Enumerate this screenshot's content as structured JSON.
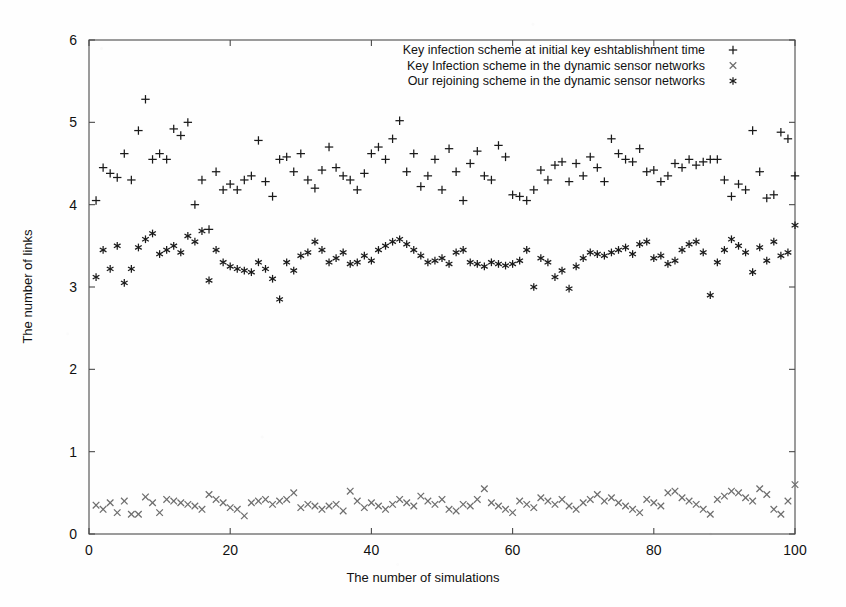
{
  "chart_data": {
    "type": "scatter",
    "title": "",
    "xlabel": "The number of simulations",
    "ylabel": "The number of links",
    "xlim": [
      0,
      100
    ],
    "ylim": [
      0,
      6
    ],
    "xticks": [
      0,
      20,
      40,
      60,
      80,
      100
    ],
    "yticks": [
      0,
      1,
      2,
      3,
      4,
      5,
      6
    ],
    "xtick_labels": [
      "0",
      "20",
      "40",
      "60",
      "80",
      "100"
    ],
    "ytick_labels": [
      "0",
      "1",
      "2",
      "3",
      "4",
      "5",
      "6"
    ],
    "grid": false,
    "legend_position": "top-center",
    "frame": true,
    "series": [
      {
        "name": "Key infection scheme at initial key eshtablishment time",
        "marker": "plus",
        "color": "#1a1a1a",
        "x": [
          1,
          2,
          3,
          4,
          5,
          6,
          7,
          8,
          9,
          10,
          11,
          12,
          13,
          14,
          15,
          16,
          17,
          18,
          19,
          20,
          21,
          22,
          23,
          24,
          25,
          26,
          27,
          28,
          29,
          30,
          31,
          32,
          33,
          34,
          35,
          36,
          37,
          38,
          39,
          40,
          41,
          42,
          43,
          44,
          45,
          46,
          47,
          48,
          49,
          50,
          51,
          52,
          53,
          54,
          55,
          56,
          57,
          58,
          59,
          60,
          61,
          62,
          63,
          64,
          65,
          66,
          67,
          68,
          69,
          70,
          71,
          72,
          73,
          74,
          75,
          76,
          77,
          78,
          79,
          80,
          81,
          82,
          83,
          84,
          85,
          86,
          87,
          88,
          89,
          90,
          91,
          92,
          93,
          94,
          95,
          96,
          97,
          98,
          99,
          100
        ],
        "y": [
          4.05,
          4.45,
          4.38,
          4.33,
          4.62,
          4.3,
          4.9,
          5.28,
          4.55,
          4.62,
          4.55,
          4.92,
          4.84,
          5.0,
          4.0,
          4.3,
          3.7,
          4.4,
          4.18,
          4.25,
          4.18,
          4.3,
          4.35,
          4.78,
          4.28,
          4.1,
          4.55,
          4.58,
          4.4,
          4.62,
          4.3,
          4.2,
          4.42,
          4.7,
          4.45,
          4.35,
          4.3,
          4.18,
          4.38,
          4.62,
          4.7,
          4.55,
          4.8,
          5.02,
          4.4,
          4.62,
          4.22,
          4.35,
          4.55,
          4.18,
          4.68,
          4.4,
          4.05,
          4.5,
          4.65,
          4.35,
          4.3,
          4.72,
          4.58,
          4.12,
          4.1,
          4.05,
          4.18,
          4.42,
          4.3,
          4.48,
          4.52,
          4.28,
          4.5,
          4.35,
          4.58,
          4.45,
          4.28,
          4.8,
          4.62,
          4.55,
          4.52,
          4.68,
          4.4,
          4.42,
          4.28,
          4.35,
          4.5,
          4.45,
          4.55,
          4.48,
          4.52,
          4.55,
          4.55,
          4.3,
          4.1,
          4.25,
          4.18,
          4.9,
          4.4,
          4.08,
          4.12,
          4.88,
          4.8,
          4.35
        ]
      },
      {
        "name": "Key Infection scheme in the dynamic sensor networks",
        "marker": "cross",
        "color": "#6e6e6e",
        "x": [
          1,
          2,
          3,
          4,
          5,
          6,
          7,
          8,
          9,
          10,
          11,
          12,
          13,
          14,
          15,
          16,
          17,
          18,
          19,
          20,
          21,
          22,
          23,
          24,
          25,
          26,
          27,
          28,
          29,
          30,
          31,
          32,
          33,
          34,
          35,
          36,
          37,
          38,
          39,
          40,
          41,
          42,
          43,
          44,
          45,
          46,
          47,
          48,
          49,
          50,
          51,
          52,
          53,
          54,
          55,
          56,
          57,
          58,
          59,
          60,
          61,
          62,
          63,
          64,
          65,
          66,
          67,
          68,
          69,
          70,
          71,
          72,
          73,
          74,
          75,
          76,
          77,
          78,
          79,
          80,
          81,
          82,
          83,
          84,
          85,
          86,
          87,
          88,
          89,
          90,
          91,
          92,
          93,
          94,
          95,
          96,
          97,
          98,
          99,
          100
        ],
        "y": [
          0.35,
          0.3,
          0.38,
          0.26,
          0.4,
          0.24,
          0.24,
          0.45,
          0.38,
          0.26,
          0.42,
          0.4,
          0.38,
          0.36,
          0.34,
          0.3,
          0.48,
          0.42,
          0.38,
          0.32,
          0.3,
          0.22,
          0.38,
          0.4,
          0.42,
          0.36,
          0.4,
          0.42,
          0.5,
          0.32,
          0.36,
          0.34,
          0.3,
          0.34,
          0.36,
          0.28,
          0.52,
          0.4,
          0.32,
          0.38,
          0.34,
          0.3,
          0.36,
          0.42,
          0.38,
          0.34,
          0.46,
          0.4,
          0.36,
          0.42,
          0.3,
          0.28,
          0.36,
          0.34,
          0.42,
          0.55,
          0.38,
          0.34,
          0.3,
          0.26,
          0.4,
          0.36,
          0.32,
          0.44,
          0.4,
          0.36,
          0.42,
          0.34,
          0.3,
          0.38,
          0.42,
          0.48,
          0.4,
          0.44,
          0.38,
          0.34,
          0.3,
          0.26,
          0.42,
          0.38,
          0.34,
          0.5,
          0.52,
          0.44,
          0.4,
          0.36,
          0.3,
          0.24,
          0.42,
          0.46,
          0.52,
          0.5,
          0.44,
          0.4,
          0.55,
          0.48,
          0.3,
          0.24,
          0.4,
          0.6
        ]
      },
      {
        "name": "Our rejoining scheme in the dynamic sensor networks",
        "marker": "asterisk",
        "color": "#1a1a1a",
        "x": [
          1,
          2,
          3,
          4,
          5,
          6,
          7,
          8,
          9,
          10,
          11,
          12,
          13,
          14,
          15,
          16,
          17,
          18,
          19,
          20,
          21,
          22,
          23,
          24,
          25,
          26,
          27,
          28,
          29,
          30,
          31,
          32,
          33,
          34,
          35,
          36,
          37,
          38,
          39,
          40,
          41,
          42,
          43,
          44,
          45,
          46,
          47,
          48,
          49,
          50,
          51,
          52,
          53,
          54,
          55,
          56,
          57,
          58,
          59,
          60,
          61,
          62,
          63,
          64,
          65,
          66,
          67,
          68,
          69,
          70,
          71,
          72,
          73,
          74,
          75,
          76,
          77,
          78,
          79,
          80,
          81,
          82,
          83,
          84,
          85,
          86,
          87,
          88,
          89,
          90,
          91,
          92,
          93,
          94,
          95,
          96,
          97,
          98,
          99,
          100
        ],
        "y": [
          3.12,
          3.45,
          3.22,
          3.5,
          3.05,
          3.22,
          3.48,
          3.58,
          3.65,
          3.4,
          3.45,
          3.5,
          3.42,
          3.62,
          3.55,
          3.68,
          3.08,
          3.45,
          3.3,
          3.25,
          3.22,
          3.2,
          3.18,
          3.3,
          3.22,
          3.1,
          2.85,
          3.3,
          3.2,
          3.38,
          3.42,
          3.55,
          3.45,
          3.3,
          3.35,
          3.42,
          3.28,
          3.3,
          3.38,
          3.32,
          3.45,
          3.5,
          3.55,
          3.58,
          3.52,
          3.45,
          3.38,
          3.3,
          3.32,
          3.35,
          3.28,
          3.42,
          3.45,
          3.3,
          3.28,
          3.25,
          3.3,
          3.28,
          3.26,
          3.28,
          3.32,
          3.45,
          3.0,
          3.35,
          3.3,
          3.12,
          3.2,
          2.98,
          3.25,
          3.35,
          3.42,
          3.4,
          3.38,
          3.42,
          3.45,
          3.48,
          3.4,
          3.52,
          3.55,
          3.35,
          3.38,
          3.28,
          3.32,
          3.45,
          3.52,
          3.55,
          3.42,
          2.9,
          3.3,
          3.45,
          3.58,
          3.5,
          3.42,
          3.18,
          3.48,
          3.32,
          3.55,
          3.38,
          3.42,
          3.75
        ]
      }
    ]
  },
  "legend": {
    "entries": [
      {
        "label": "Key infection scheme at initial key eshtablishment time",
        "marker": "+"
      },
      {
        "label": "Key Infection scheme in the dynamic sensor networks",
        "marker": "×"
      },
      {
        "label": "Our rejoining scheme in the dynamic sensor networks",
        "marker": "∗"
      }
    ]
  }
}
